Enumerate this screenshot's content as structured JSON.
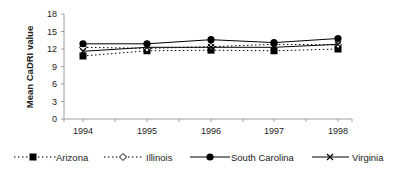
{
  "chart_data": {
    "type": "line",
    "title": "",
    "xlabel": "",
    "ylabel": "Mean CaDRI value",
    "ylim": [
      0,
      18
    ],
    "yticks": [
      0,
      3,
      6,
      9,
      12,
      15,
      18
    ],
    "categories": [
      "1994",
      "1995",
      "1996",
      "1997",
      "1998"
    ],
    "grid": false,
    "legend_position": "bottom",
    "series": [
      {
        "name": "Arizona",
        "line": "dotted",
        "marker": "filled-square",
        "values": [
          10.8,
          11.7,
          11.8,
          11.7,
          12.0
        ]
      },
      {
        "name": "Illinois",
        "line": "dotted",
        "marker": "open-diamond",
        "values": [
          12.3,
          12.1,
          12.4,
          12.8,
          12.7
        ]
      },
      {
        "name": "South Carolina",
        "line": "solid",
        "marker": "filled-circle",
        "values": [
          12.9,
          12.9,
          13.6,
          13.1,
          13.8
        ]
      },
      {
        "name": "Virginia",
        "line": "solid",
        "marker": "x",
        "values": [
          11.6,
          12.3,
          12.3,
          12.3,
          12.8
        ]
      }
    ]
  },
  "axis": {
    "ylabel": "Mean CaDRI value",
    "yticks": [
      "0",
      "3",
      "6",
      "9",
      "12",
      "15",
      "18"
    ],
    "xticks": [
      "1994",
      "1995",
      "1996",
      "1997",
      "1998"
    ]
  },
  "legend": {
    "items": [
      {
        "label": "Arizona"
      },
      {
        "label": "Illinois"
      },
      {
        "label": "South Carolina"
      },
      {
        "label": "Virginia"
      }
    ]
  }
}
